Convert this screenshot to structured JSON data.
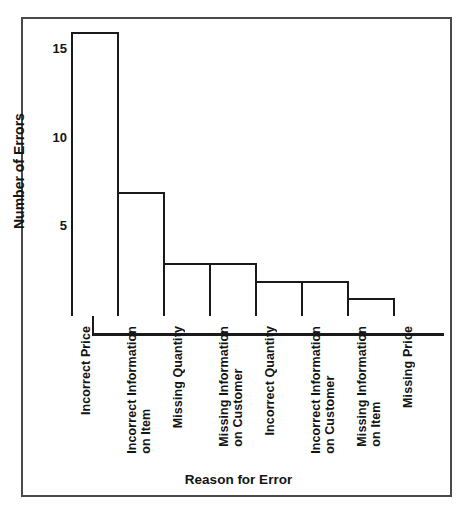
{
  "chart_data": {
    "type": "bar",
    "title": "",
    "xlabel": "Reason for Error",
    "ylabel": "Number of Errors",
    "categories": [
      "Incorrect Price",
      "Incorrect Information\non Item",
      "Missing Quantity",
      "Missing Information\non Customer",
      "Incorrect Quantity",
      "Incorrect Information\non Customer",
      "Missing Information\non Item",
      "Missing Price"
    ],
    "values": [
      16,
      7,
      3,
      3,
      2,
      2,
      1,
      0
    ],
    "ylim": [
      0,
      16
    ],
    "yticks": [
      5,
      10,
      15
    ],
    "ytick_labels": [
      "5",
      "10",
      "15"
    ],
    "grid": false,
    "legend": null,
    "bar_fill_color": "#ffffff",
    "bar_edge_color": "#1a1a1a",
    "axis_color": "#1a1a1a",
    "frame_color": "#4a4a4a",
    "background_color": "#ffffff"
  }
}
